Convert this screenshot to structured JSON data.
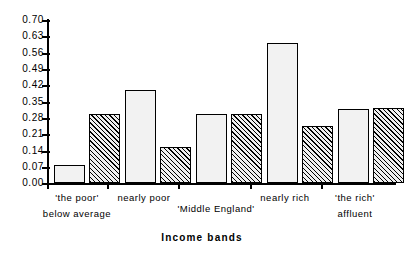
{
  "chart_data": {
    "type": "bar",
    "title": "",
    "xlabel": "Income bands",
    "ylabel": "",
    "ylim": [
      0.0,
      0.7
    ],
    "grid": false,
    "legend": "none",
    "categories": [
      "'the poor' below average",
      "nearly poor",
      "'Middle England'",
      "nearly rich",
      "'the rich' affluent"
    ],
    "yticks": [
      "0.00",
      "0.07",
      "0.14",
      "0.21",
      "0.28",
      "0.35",
      "0.42",
      "0.49",
      "0.56",
      "0.63",
      "0.70"
    ],
    "ytick_values": [
      0.0,
      0.07,
      0.14,
      0.21,
      0.28,
      0.35,
      0.42,
      0.49,
      0.56,
      0.63,
      0.7
    ],
    "series": [
      {
        "name": "dotted",
        "values": [
          0.08,
          0.4,
          0.3,
          0.605,
          0.32
        ]
      },
      {
        "name": "hatched",
        "values": [
          0.3,
          0.155,
          0.3,
          0.245,
          0.325
        ]
      }
    ]
  },
  "axis": {
    "x_title": "Income bands"
  },
  "groups": [
    {
      "line1": "'the  poor'",
      "line2": "below  average"
    },
    {
      "line1": "nearly  poor",
      "line2": ""
    },
    {
      "line1": "'Middle  England'",
      "line2": ""
    },
    {
      "line1": "nearly  rich",
      "line2": ""
    },
    {
      "line1": "'the  rich'",
      "line2": "affluent"
    }
  ]
}
